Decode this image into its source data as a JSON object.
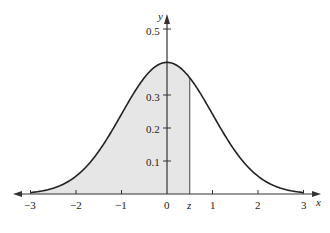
{
  "chart_data": {
    "type": "area",
    "title": "",
    "xlabel": "x",
    "ylabel": "y",
    "x_ticks": [
      "-3",
      "-2",
      "-1",
      "0",
      "z",
      "1",
      "2",
      "3"
    ],
    "x_tick_values": [
      -3,
      -2,
      -1,
      0,
      0.5,
      1,
      2,
      3
    ],
    "y_ticks": [
      "0.1",
      "0.2",
      "0.3",
      "0.5"
    ],
    "y_tick_values": [
      0.1,
      0.2,
      0.3,
      0.5
    ],
    "xlim": [
      -3.3,
      3.3
    ],
    "ylim": [
      0,
      0.52
    ],
    "grid": false,
    "series": [
      {
        "name": "standard normal pdf",
        "function": "y = (1/sqrt(2*pi)) * exp(-x^2/2)",
        "x": [
          -3,
          -2.5,
          -2,
          -1.5,
          -1,
          -0.5,
          0,
          0.5,
          1,
          1.5,
          2,
          2.5,
          3
        ],
        "values": [
          0.004,
          0.018,
          0.054,
          0.13,
          0.242,
          0.352,
          0.399,
          0.352,
          0.242,
          0.13,
          0.054,
          0.018,
          0.004
        ]
      }
    ],
    "shaded_region": {
      "from": -3,
      "to": 0.5,
      "label": "z",
      "color": "#e6e6e6"
    }
  },
  "labels": {
    "x_axis": "x",
    "y_axis": "y",
    "z_marker": "z",
    "xt0": "−3",
    "xt1": "−2",
    "xt2": "−1",
    "xt3": "0",
    "xt4": "1",
    "xt5": "2",
    "xt6": "3",
    "yt1": "0.1",
    "yt2": "0.2",
    "yt3": "0.3",
    "yt5": "0.5"
  },
  "colors": {
    "curve": "#222222",
    "shade": "#e6e6e6",
    "axis": "#333333"
  }
}
